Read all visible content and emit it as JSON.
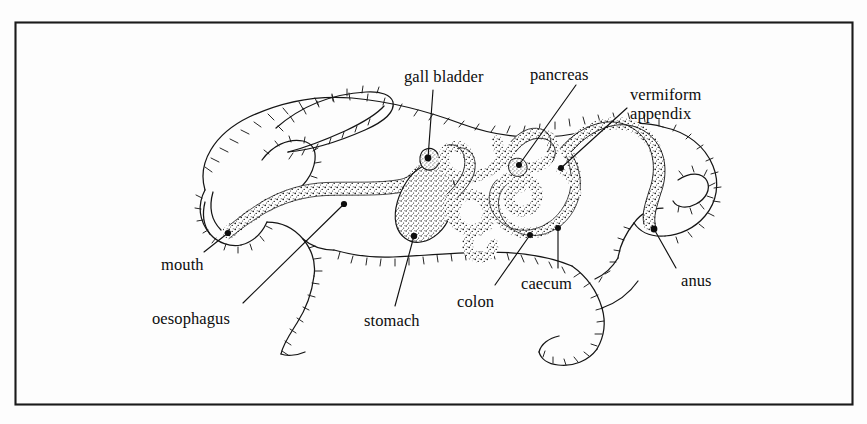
{
  "figure": {
    "kind": "anatomical-line-drawing",
    "background_color": "#fdfdfd",
    "ink_color": "#111111",
    "frame": {
      "stroke_color": "#1a1a1a",
      "x": 15,
      "y": 22,
      "width": 837,
      "height": 382
    }
  },
  "labels": [
    {
      "id": "gall-bladder",
      "text": "gall bladder",
      "x": 404,
      "y": 68,
      "align": "left",
      "lines": 1
    },
    {
      "id": "pancreas",
      "text": "pancreas",
      "x": 530,
      "y": 66,
      "align": "left",
      "lines": 1
    },
    {
      "id": "vermiform-appendix",
      "text": "vermiform\nappendix",
      "x": 630,
      "y": 85,
      "align": "left",
      "lines": 2
    },
    {
      "id": "mouth",
      "text": "mouth",
      "x": 161,
      "y": 256,
      "align": "left",
      "lines": 1
    },
    {
      "id": "oesophagus",
      "text": "oesophagus",
      "x": 152,
      "y": 310,
      "align": "left",
      "lines": 1
    },
    {
      "id": "stomach",
      "text": "stomach",
      "x": 364,
      "y": 312,
      "align": "left",
      "lines": 1
    },
    {
      "id": "colon",
      "text": "colon",
      "x": 457,
      "y": 293,
      "align": "left",
      "lines": 1
    },
    {
      "id": "caecum",
      "text": "caecum",
      "x": 521,
      "y": 275,
      "align": "left",
      "lines": 1
    },
    {
      "id": "anus",
      "text": "anus",
      "x": 681,
      "y": 272,
      "align": "left",
      "lines": 1
    }
  ],
  "leader_lines": [
    {
      "id": "gall-bladder-leader",
      "x1": 433,
      "y1": 90,
      "x2": 428,
      "y2": 158
    },
    {
      "id": "pancreas-leader",
      "x1": 576,
      "y1": 85,
      "x2": 519,
      "y2": 165
    },
    {
      "id": "vermiform-appendix-leader",
      "x1": 627,
      "y1": 108,
      "x2": 561,
      "y2": 168
    },
    {
      "id": "mouth-leader",
      "x1": 204,
      "y1": 252,
      "x2": 228,
      "y2": 233
    },
    {
      "id": "oesophagus-leader",
      "x1": 243,
      "y1": 303,
      "x2": 344,
      "y2": 204
    },
    {
      "id": "stomach-leader",
      "x1": 395,
      "y1": 306,
      "x2": 414,
      "y2": 236
    },
    {
      "id": "colon-leader",
      "x1": 495,
      "y1": 285,
      "x2": 530,
      "y2": 235
    },
    {
      "id": "caecum-leader",
      "x1": 558,
      "y1": 268,
      "x2": 558,
      "y2": 228
    },
    {
      "id": "anus-leader",
      "x1": 676,
      "y1": 268,
      "x2": 654,
      "y2": 229
    }
  ],
  "organ_markers": [
    {
      "id": "mouth-marker",
      "cx": 228,
      "cy": 233,
      "r": 3.1
    },
    {
      "id": "oesophagus-marker",
      "cx": 344,
      "cy": 204,
      "r": 3.1
    },
    {
      "id": "gall-bladder-marker",
      "cx": 428,
      "cy": 158,
      "r": 3.4
    },
    {
      "id": "stomach-marker",
      "cx": 414,
      "cy": 236,
      "r": 3.2
    },
    {
      "id": "pancreas-marker",
      "cx": 519,
      "cy": 165,
      "r": 3.0
    },
    {
      "id": "appendix-marker",
      "cx": 561,
      "cy": 168,
      "r": 3.0
    },
    {
      "id": "colon-marker",
      "cx": 530,
      "cy": 235,
      "r": 3.0
    },
    {
      "id": "caecum-marker",
      "cx": 558,
      "cy": 228,
      "r": 3.0
    },
    {
      "id": "anus-marker",
      "cx": 654,
      "cy": 229,
      "r": 3.4
    }
  ],
  "organs": [
    {
      "id": "oesophagus-tube",
      "name": "oesophagus",
      "style": "stippled-tube"
    },
    {
      "id": "stomach-sac",
      "name": "stomach",
      "style": "stippled-sac"
    },
    {
      "id": "small-intestine",
      "name": "small intestine coil",
      "style": "stippled-tube"
    },
    {
      "id": "caecum-coil",
      "name": "caecum",
      "style": "stippled-spiral"
    },
    {
      "id": "colon-tube",
      "name": "colon",
      "style": "stippled-tube"
    },
    {
      "id": "appendix-tip",
      "name": "vermiform appendix",
      "style": "stippled-tube"
    }
  ],
  "animal": {
    "species": "rabbit",
    "pose": "crouching, facing left",
    "parts": [
      "head",
      "ear",
      "foreleg",
      "hindleg",
      "tail",
      "body-outline"
    ]
  }
}
